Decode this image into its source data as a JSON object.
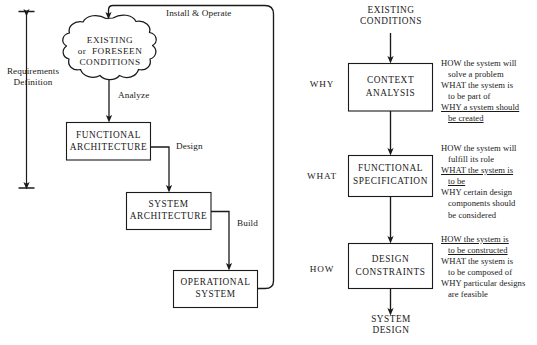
{
  "diagram": {
    "left_panel": {
      "bracket_label": "Requirements\nDefinition",
      "cloud": {
        "line1": "EXISTING",
        "line2": "or  FORESEEN",
        "line3": "CONDITIONS"
      },
      "boxes": [
        {
          "id": "functional-architecture",
          "line1": "FUNCTIONAL",
          "line2": "ARCHITECTURE"
        },
        {
          "id": "system-architecture",
          "line1": "SYSTEM",
          "line2": "ARCHITECTURE"
        },
        {
          "id": "operational-system",
          "line1": "OPERATIONAL",
          "line2": "SYSTEM"
        }
      ],
      "edge_labels": {
        "install_operate": "Install & Operate",
        "analyze": "Analyze",
        "design": "Design",
        "build": "Build"
      }
    },
    "right_panel": {
      "input_label": "EXISTING\nCONDITIONS",
      "output_label": "SYSTEM\nDESIGN",
      "stages": [
        {
          "id": "context-analysis",
          "side_label": "WHY",
          "box_line1": "CONTEXT",
          "box_line2": "ANALYSIS",
          "annotation": [
            {
              "text": "HOW the system will",
              "underline": false,
              "indent": false
            },
            {
              "text": "solve a problem",
              "underline": false,
              "indent": true
            },
            {
              "text": "WHAT the system is",
              "underline": false,
              "indent": false
            },
            {
              "text": "to be part of",
              "underline": false,
              "indent": true
            },
            {
              "text": "WHY a system should",
              "underline": true,
              "indent": false
            },
            {
              "text": "be created",
              "underline": true,
              "indent": true
            }
          ]
        },
        {
          "id": "functional-specification",
          "side_label": "WHAT",
          "box_line1": "FUNCTIONAL",
          "box_line2": "SPECIFICATION",
          "annotation": [
            {
              "text": "HOW the system will",
              "underline": false,
              "indent": false
            },
            {
              "text": "fulfill its role",
              "underline": false,
              "indent": true
            },
            {
              "text": "WHAT the system is",
              "underline": true,
              "indent": false
            },
            {
              "text": "to be",
              "underline": true,
              "indent": true
            },
            {
              "text": "WHY certain design",
              "underline": false,
              "indent": false
            },
            {
              "text": "components should",
              "underline": false,
              "indent": true
            },
            {
              "text": "be considered",
              "underline": false,
              "indent": true
            }
          ]
        },
        {
          "id": "design-constraints",
          "side_label": "HOW",
          "box_line1": "DESIGN",
          "box_line2": "CONSTRAINTS",
          "annotation": [
            {
              "text": "HOW the system is",
              "underline": true,
              "indent": false
            },
            {
              "text": "to be constructed",
              "underline": true,
              "indent": true
            },
            {
              "text": "WHAT the system is",
              "underline": false,
              "indent": false
            },
            {
              "text": "to be composed of",
              "underline": false,
              "indent": true
            },
            {
              "text": "WHY particular designs",
              "underline": false,
              "indent": false
            },
            {
              "text": "are feasible",
              "underline": false,
              "indent": true
            }
          ]
        }
      ]
    },
    "colors": {
      "ink": "#1a1a1a",
      "stroke": "#2b2b2b",
      "background": "#ffffff"
    }
  }
}
